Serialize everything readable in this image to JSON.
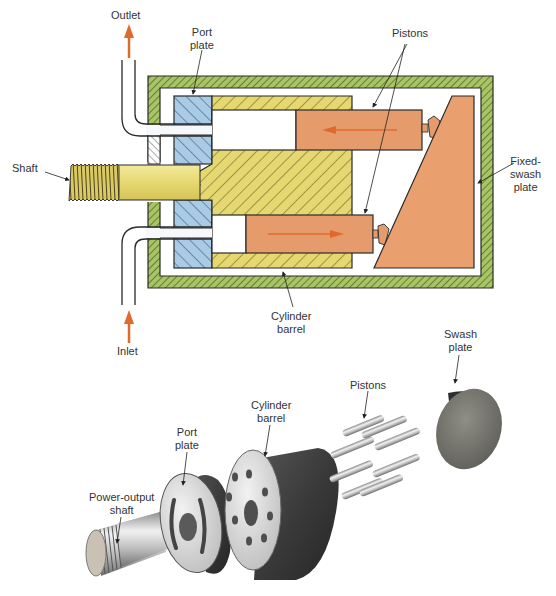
{
  "colors": {
    "housing": "#a8c464",
    "port_plate": "#a9cbe6",
    "cylinder_barrel": "#e6d870",
    "shaft": "#e9dc7a",
    "piston": "#e59b6b",
    "swash_plate": "#e9a06e",
    "flow_arrow": "#e06a2c",
    "outline": "#2a2a2a"
  },
  "cross_section": {
    "labels": {
      "outlet": "Outlet",
      "port_plate": "Port\nplate",
      "pistons": "Pistons",
      "shaft": "Shaft",
      "fixed_swash_plate": "Fixed-\nswash\nplate",
      "cylinder_barrel": "Cylinder\nbarrel",
      "inlet": "Inlet"
    },
    "flow": {
      "upper_piston_direction": "left",
      "lower_piston_direction": "right",
      "outlet_direction": "up",
      "inlet_direction": "up"
    }
  },
  "exploded_view": {
    "labels": {
      "power_output_shaft": "Power-output\nshaft",
      "port_plate": "Port\nplate",
      "cylinder_barrel": "Cylinder\nbarrel",
      "pistons": "Pistons",
      "swash_plate": "Swash\nplate"
    },
    "piston_count": 8,
    "barrel_bore_count": 8
  }
}
